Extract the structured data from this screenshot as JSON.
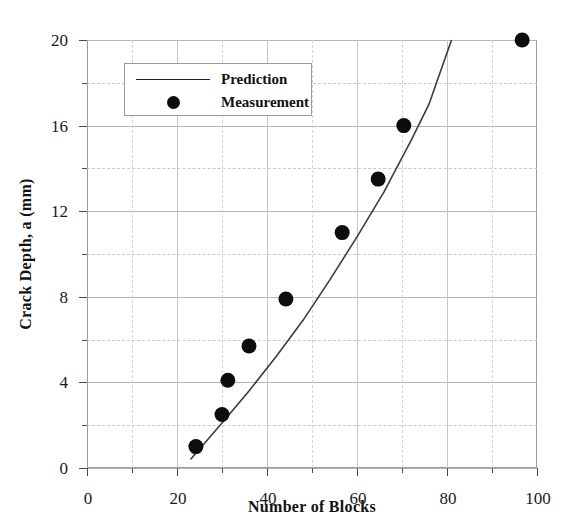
{
  "chart_data": {
    "type": "scatter",
    "title": "",
    "xlabel": "Number of Blocks",
    "ylabel": "Crack Depth, a (mm)",
    "xlim": [
      0,
      100
    ],
    "ylim": [
      0,
      20
    ],
    "x_major_ticks": [
      0,
      20,
      40,
      60,
      80,
      100
    ],
    "x_minor_ticks": [
      10,
      30,
      50,
      70,
      90
    ],
    "y_major_ticks": [
      0,
      4,
      8,
      12,
      16,
      20
    ],
    "y_minor_ticks": [
      2,
      6,
      10,
      14,
      18
    ],
    "x_tick_labels": [
      "0",
      "20",
      "40",
      "60",
      "80",
      "100"
    ],
    "y_tick_labels": [
      "0",
      "4",
      "8",
      "12",
      "16",
      "20"
    ],
    "grid": true,
    "legend_position": "upper-left-inside",
    "series": [
      {
        "name": "Prediction",
        "type": "line",
        "marker": "none",
        "color": "#3c3c3c",
        "x": [
          23.0,
          30.0,
          36.0,
          42.0,
          48.0,
          54.0,
          60.0,
          66.0,
          72.0,
          76.0,
          81.0
        ],
        "y": [
          0.4,
          2.1,
          3.6,
          5.2,
          6.9,
          8.8,
          10.8,
          12.9,
          15.3,
          17.0,
          20.0
        ]
      },
      {
        "name": "Measurement",
        "type": "scatter",
        "marker": "filled-circle",
        "color": "#0d0d0d",
        "x": [
          24.2,
          30.0,
          31.3,
          36.0,
          44.2,
          56.7,
          64.7,
          70.4,
          96.7
        ],
        "y": [
          1.0,
          2.5,
          4.1,
          5.7,
          7.9,
          11.0,
          13.5,
          16.0,
          20.0
        ]
      }
    ],
    "legend": [
      {
        "label": "Prediction",
        "key": "line"
      },
      {
        "label": "Measurement",
        "key": "dot"
      }
    ]
  }
}
